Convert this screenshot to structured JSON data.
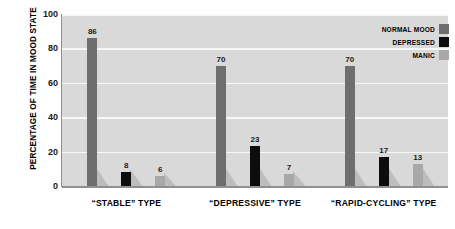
{
  "chart_data": {
    "type": "bar",
    "title": "",
    "subtitle": "",
    "xlabel": "",
    "ylabel": "PERCENTAGE OF TIME IN MOOD STATE",
    "ylim": [
      0,
      100
    ],
    "yticks": [
      0,
      20,
      40,
      60,
      80,
      100
    ],
    "ytick_labels": [
      "0",
      "20",
      "40",
      "60",
      "80",
      "100"
    ],
    "grid": true,
    "grid_axis": "y",
    "legend_position": "top-right",
    "categories": [
      "“STABLE” TYPE",
      "“DEPRESSIVE” TYPE",
      "“RAPID-CYCLING” TYPE"
    ],
    "series": [
      {
        "name": "NORMAL MOOD",
        "color": "#6e6e6e",
        "values": [
          86,
          70,
          70
        ],
        "value_labels": [
          "86",
          "70",
          "70"
        ]
      },
      {
        "name": "DEPRESSED",
        "color": "#0d0d0d",
        "values": [
          8,
          23,
          17
        ],
        "value_labels": [
          "8",
          "23",
          "17"
        ]
      },
      {
        "name": "MANIC",
        "color": "#a8a8a8",
        "values": [
          6,
          7,
          13
        ],
        "value_labels": [
          "6",
          "7",
          "13"
        ]
      }
    ],
    "plot_background": "#d9d9d9",
    "gridline_color": "#f7f7f7",
    "axis_color": "#8f8f8f",
    "page_background": "#ffffff",
    "text_color": "#000000"
  }
}
